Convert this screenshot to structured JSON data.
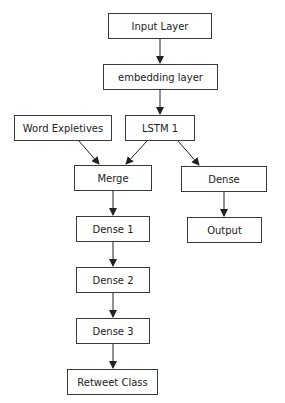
{
  "diagram": {
    "type": "flowchart",
    "nodes": {
      "input_layer": {
        "label": "Input Layer",
        "x": 108,
        "y": 13,
        "w": 104,
        "h": 26
      },
      "embedding_layer": {
        "label": "embedding layer",
        "x": 103,
        "y": 64,
        "w": 115,
        "h": 26
      },
      "word_expletives": {
        "label": "Word Expletives",
        "x": 14,
        "y": 115,
        "w": 98,
        "h": 26
      },
      "lstm1": {
        "label": "LSTM 1",
        "x": 125,
        "y": 115,
        "w": 70,
        "h": 26
      },
      "merge": {
        "label": "Merge",
        "x": 74,
        "y": 165,
        "w": 78,
        "h": 26
      },
      "dense": {
        "label": "Dense",
        "x": 181,
        "y": 166,
        "w": 86,
        "h": 26
      },
      "dense1": {
        "label": "Dense 1",
        "x": 76,
        "y": 216,
        "w": 74,
        "h": 26
      },
      "output": {
        "label": "Output",
        "x": 187,
        "y": 217,
        "w": 75,
        "h": 26
      },
      "dense2": {
        "label": "Dense 2",
        "x": 76,
        "y": 267,
        "w": 74,
        "h": 26
      },
      "dense3": {
        "label": "Dense 3",
        "x": 76,
        "y": 318,
        "w": 74,
        "h": 26
      },
      "retweet_class": {
        "label": "Retweet Class",
        "x": 67,
        "y": 369,
        "w": 91,
        "h": 26
      }
    },
    "edges": [
      {
        "from": "input_layer",
        "to": "embedding_layer"
      },
      {
        "from": "embedding_layer",
        "to": "lstm1"
      },
      {
        "from": "word_expletives",
        "to": "merge"
      },
      {
        "from": "lstm1",
        "to": "merge"
      },
      {
        "from": "lstm1",
        "to": "dense"
      },
      {
        "from": "merge",
        "to": "dense1"
      },
      {
        "from": "dense",
        "to": "output"
      },
      {
        "from": "dense1",
        "to": "dense2"
      },
      {
        "from": "dense2",
        "to": "dense3"
      },
      {
        "from": "dense3",
        "to": "retweet_class"
      }
    ],
    "colors": {
      "border": "#3a3a3a",
      "text": "#222222",
      "arrow": "#222222",
      "background": "#ffffff"
    }
  }
}
